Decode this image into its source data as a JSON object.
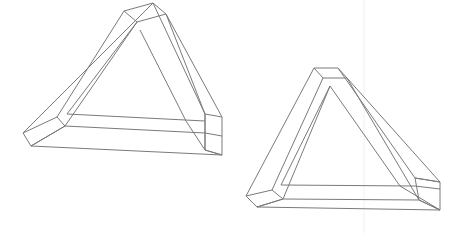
{
  "document": {
    "title": "Penrose Triangles",
    "background_color": "#ffffff",
    "width": 462,
    "height": 233
  },
  "style": {
    "stroke_color": "#7a7a7a",
    "stroke_width": 1,
    "face_fill": "#ffffff",
    "guide_color": "#f0f0f0"
  },
  "guides": [
    {
      "name": "vertical-guide",
      "x1": 364,
      "y1": 0,
      "x2": 364,
      "y2": 233
    }
  ],
  "figures": [
    {
      "id": "left-penrose-triangle",
      "label": "Penrose triangle (left)",
      "orientation": "wide, apex cut off at top edge",
      "bounds": {
        "x": 23,
        "y": 0,
        "width": 200,
        "height": 160
      },
      "apex": {
        "x": 140,
        "y": 4
      },
      "left_vertex": {
        "x": 23,
        "y": 133
      },
      "right_vertex": {
        "x": 222,
        "y": 155
      },
      "faces": [
        {
          "name": "apex-cap",
          "points": "124,11 153,3 166,14 137,22"
        },
        {
          "name": "bottom-left-cap",
          "points": "23,133 57,117 65,126 31,146"
        },
        {
          "name": "right-end-cap",
          "points": "205,114 222,117 222,155 205,150"
        }
      ],
      "edges": [
        {
          "name": "outer-left-upper",
          "d": "M 153,3 L 23,133"
        },
        {
          "name": "outer-bottom",
          "d": "M 31,146 L 222,155"
        },
        {
          "name": "outer-right-upper",
          "d": "M 166,14 L 222,117"
        },
        {
          "name": "left-beam-inner",
          "d": "M 124,11 L 57,117"
        },
        {
          "name": "inner-left-rail",
          "d": "M 137,22 L 65,126"
        },
        {
          "name": "bottom-beam-top",
          "d": "M 65,126 L 205,133"
        },
        {
          "name": "bottom-rail-lower",
          "d": "M 31,146 L 65,126"
        },
        {
          "name": "bottom-inner-rail",
          "d": "M 67,114 L 205,121"
        },
        {
          "name": "inner-triangle-left",
          "d": "M 137,22 L 67,114"
        },
        {
          "name": "right-beam-outer",
          "d": "M 166,14 L 205,114"
        },
        {
          "name": "right-beam-inner",
          "d": "M 153,3 L 205,114"
        },
        {
          "name": "right-inner-rail",
          "d": "M 140,30 L 186,121"
        },
        {
          "name": "right-cap-edge",
          "d": "M 205,150 L 222,155"
        },
        {
          "name": "right-cap-left",
          "d": "M 205,114 L 205,150"
        },
        {
          "name": "bottom-rail-right-end",
          "d": "M 205,133 L 222,136"
        },
        {
          "name": "bottom-face-lower-right",
          "d": "M 205,150 L 186,121"
        }
      ]
    },
    {
      "id": "right-penrose-triangle",
      "label": "Penrose triangle (right)",
      "orientation": "narrow, apex near top of figure",
      "bounds": {
        "x": 246,
        "y": 65,
        "width": 194,
        "height": 152
      },
      "apex": {
        "x": 318,
        "y": 68
      },
      "left_vertex": {
        "x": 246,
        "y": 196
      },
      "right_vertex": {
        "x": 440,
        "y": 210
      },
      "faces": [
        {
          "name": "apex-cap",
          "points": "314,68 338,68 347,78 323,78"
        },
        {
          "name": "bottom-left-cap",
          "points": "246,196 272,190 283,199 257,207"
        },
        {
          "name": "right-end-cap",
          "points": "415,178 440,182 440,210 419,200"
        }
      ],
      "edges": [
        {
          "name": "outer-left-upper",
          "d": "M 314,68 L 246,196"
        },
        {
          "name": "outer-bottom",
          "d": "M 257,207 L 440,210"
        },
        {
          "name": "outer-right-upper",
          "d": "M 347,78 L 440,182"
        },
        {
          "name": "left-beam-inner",
          "d": "M 323,78 L 272,190"
        },
        {
          "name": "inner-left-rail",
          "d": "M 330,86 L 283,199"
        },
        {
          "name": "bottom-beam-top",
          "d": "M 283,199 L 419,200"
        },
        {
          "name": "bottom-inner-rail",
          "d": "M 281,185 L 415,186"
        },
        {
          "name": "bottom-rail-lower",
          "d": "M 257,207 L 283,199"
        },
        {
          "name": "inner-triangle-left",
          "d": "M 330,86 L 281,185"
        },
        {
          "name": "right-beam-outer",
          "d": "M 338,68 L 415,178"
        },
        {
          "name": "right-beam-inner",
          "d": "M 330,86 L 400,186"
        },
        {
          "name": "right-inner-rail",
          "d": "M 347,78 L 419,200"
        },
        {
          "name": "right-cap-edge",
          "d": "M 415,178 L 440,182"
        },
        {
          "name": "right-cap-lower",
          "d": "M 419,200 L 440,210"
        },
        {
          "name": "bottom-right-diagonal",
          "d": "M 400,186 L 440,210"
        },
        {
          "name": "bottom-rail-right-end",
          "d": "M 415,186 L 440,189"
        }
      ]
    }
  ]
}
